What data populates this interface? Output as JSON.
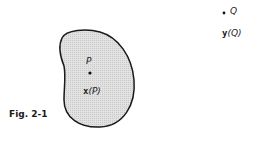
{
  "figure": {
    "caption": "Fig. 2-1",
    "region": {
      "fill": "#dcdcdc",
      "stroke": "#1a1a1a"
    },
    "point_p": {
      "name": "P",
      "coord_bold": "x",
      "coord_paren": "(P)"
    },
    "point_q": {
      "name": "Q",
      "coord_bold": "y",
      "coord_paren": "(Q)"
    }
  }
}
